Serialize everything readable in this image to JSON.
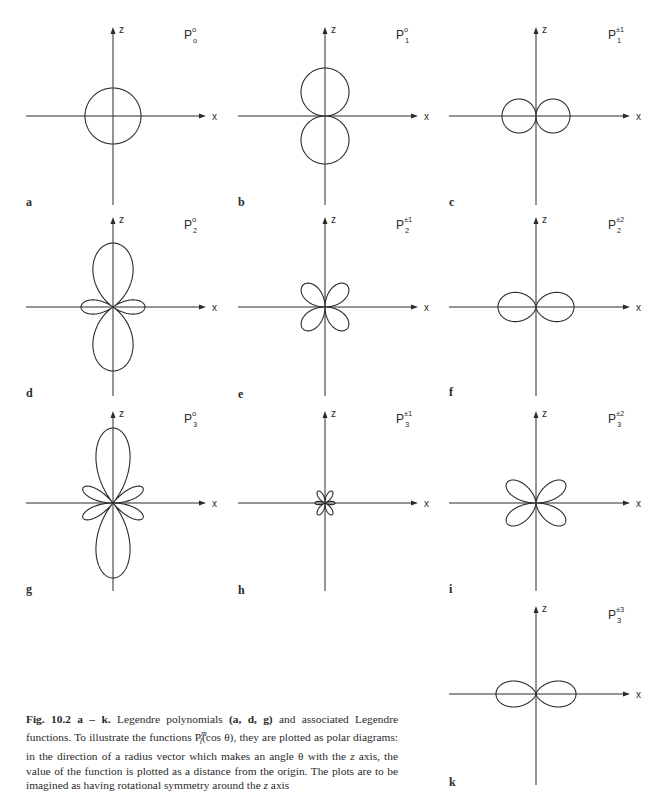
{
  "figure": {
    "number": "Fig. 10.2 a – k.",
    "caption": {
      "lead": "Fig. 10.2 a – k.",
      "part1": " Legendre polynomials ",
      "bold_refs": "(a, d, g)",
      "part2": " and associated Legendre functions. To illustrate the functions P",
      "sup": "m",
      "sub": "l",
      "part3": "(cos θ), they are plotted as polar diagrams: in the direction of a radius vector which makes an angle θ with the ",
      "z_italic": "z",
      "part4": " axis, the value of the function is plotted as a distance from the origin. The plots are to be imagined as having rotational symmetry around the ",
      "z_italic2": "z",
      "part5": " axis"
    },
    "axis_labels": {
      "x": "x",
      "z": "z"
    },
    "line_color": "#2b2b2b"
  },
  "chart_data": [
    {
      "type": "polar",
      "panel": "a",
      "title": "P₀⁰",
      "l": 0,
      "m": "0",
      "func": "1",
      "cx": 113,
      "cy": 116,
      "scale": 28
    },
    {
      "type": "polar",
      "panel": "b",
      "title": "P₁⁰",
      "l": 1,
      "m": "0",
      "func": "cos",
      "cx": 325,
      "cy": 116,
      "scale": 48
    },
    {
      "type": "polar",
      "panel": "c",
      "title": "P₁^±1",
      "l": 1,
      "m": "±1",
      "func": "sin",
      "cx": 536,
      "cy": 116,
      "scale": 34
    },
    {
      "type": "polar",
      "panel": "d",
      "title": "P₂⁰",
      "l": 2,
      "m": "0",
      "func": "p20",
      "cx": 113,
      "cy": 307,
      "scale": 64
    },
    {
      "type": "polar",
      "panel": "e",
      "title": "P₂^±1",
      "l": 2,
      "m": "±1",
      "func": "p21",
      "cx": 325,
      "cy": 307,
      "scale": 62
    },
    {
      "type": "polar",
      "panel": "f",
      "title": "P₂^±2",
      "l": 2,
      "m": "±2",
      "func": "p22",
      "cx": 536,
      "cy": 307,
      "scale": 38
    },
    {
      "type": "polar",
      "panel": "g",
      "title": "P₃⁰",
      "l": 3,
      "m": "0",
      "func": "p30",
      "cx": 113,
      "cy": 503,
      "scale": 75
    },
    {
      "type": "polar",
      "panel": "h",
      "title": "P₃^±1",
      "l": 3,
      "m": "±1",
      "func": "p31",
      "cx": 325,
      "cy": 503,
      "scale": 40
    },
    {
      "type": "polar",
      "panel": "i",
      "title": "P₃^±2",
      "l": 3,
      "m": "±2",
      "func": "p32",
      "cx": 536,
      "cy": 503,
      "scale": 92
    },
    {
      "type": "polar",
      "panel": "k",
      "title": "P₃^±3",
      "l": 3,
      "m": "±3",
      "func": "p33",
      "cx": 536,
      "cy": 694,
      "scale": 40
    }
  ],
  "panels": [
    {
      "id": "a",
      "label": "a",
      "sym_base": "P",
      "sym_sup": "o",
      "sym_sub": "o",
      "cx": 113,
      "cy": 116,
      "ztop": 27,
      "zbot": 205,
      "xl": 26,
      "xr": 206,
      "label_x": 26,
      "label_y": 196,
      "title_x": 190,
      "title_y": 26
    },
    {
      "id": "b",
      "label": "b",
      "sym_base": "P",
      "sym_sup": "o",
      "sym_sub": "1",
      "cx": 325,
      "cy": 116,
      "ztop": 27,
      "zbot": 205,
      "xl": 238,
      "xr": 418,
      "label_x": 238,
      "label_y": 196,
      "title_x": 402,
      "title_y": 26
    },
    {
      "id": "c",
      "label": "c",
      "sym_base": "P",
      "sym_sup": "±1",
      "sym_sub": "1",
      "cx": 536,
      "cy": 116,
      "ztop": 27,
      "zbot": 205,
      "xl": 449,
      "xr": 630,
      "label_x": 449,
      "label_y": 196,
      "title_x": 614,
      "title_y": 26
    },
    {
      "id": "d",
      "label": "d",
      "sym_base": "P",
      "sym_sup": "o",
      "sym_sub": "2",
      "cx": 113,
      "cy": 307,
      "ztop": 217,
      "zbot": 396,
      "xl": 26,
      "xr": 206,
      "label_x": 26,
      "label_y": 387,
      "title_x": 190,
      "title_y": 216
    },
    {
      "id": "e",
      "label": "e",
      "sym_base": "P",
      "sym_sup": "±1",
      "sym_sub": "2",
      "cx": 325,
      "cy": 307,
      "ztop": 217,
      "zbot": 396,
      "xl": 238,
      "xr": 418,
      "label_x": 238,
      "label_y": 388,
      "title_x": 402,
      "title_y": 216
    },
    {
      "id": "f",
      "label": "f",
      "sym_base": "P",
      "sym_sup": "±2",
      "sym_sub": "2",
      "cx": 536,
      "cy": 307,
      "ztop": 217,
      "zbot": 396,
      "xl": 449,
      "xr": 630,
      "label_x": 449,
      "label_y": 386,
      "title_x": 614,
      "title_y": 216
    },
    {
      "id": "g",
      "label": "g",
      "sym_base": "P",
      "sym_sup": "o",
      "sym_sub": "3",
      "cx": 113,
      "cy": 503,
      "ztop": 411,
      "zbot": 591,
      "xl": 26,
      "xr": 206,
      "label_x": 26,
      "label_y": 583,
      "title_x": 190,
      "title_y": 410
    },
    {
      "id": "h",
      "label": "h",
      "sym_base": "P",
      "sym_sup": "±1",
      "sym_sub": "3",
      "cx": 325,
      "cy": 503,
      "ztop": 411,
      "zbot": 591,
      "xl": 238,
      "xr": 418,
      "label_x": 238,
      "label_y": 584,
      "title_x": 402,
      "title_y": 410
    },
    {
      "id": "i",
      "label": "i",
      "sym_base": "P",
      "sym_sup": "±2",
      "sym_sub": "3",
      "cx": 536,
      "cy": 503,
      "ztop": 411,
      "zbot": 591,
      "xl": 449,
      "xr": 630,
      "label_x": 449,
      "label_y": 583,
      "title_x": 614,
      "title_y": 410
    },
    {
      "id": "k",
      "label": "k",
      "sym_base": "P",
      "sym_sup": "±3",
      "sym_sub": "3",
      "cx": 536,
      "cy": 694,
      "ztop": 606,
      "zbot": 785,
      "xl": 449,
      "xr": 630,
      "label_x": 449,
      "label_y": 776,
      "title_x": 614,
      "title_y": 606
    }
  ]
}
